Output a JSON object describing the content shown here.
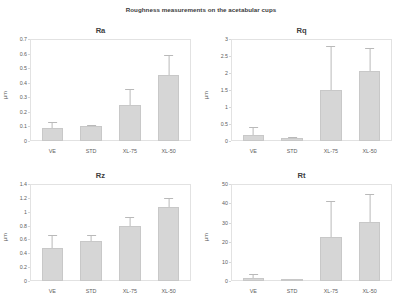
{
  "figure": {
    "title": "Roughness measurements on the acetabular cups"
  },
  "chart_data": [
    {
      "type": "bar",
      "title": "Ra",
      "xlabel": "",
      "ylabel": "µm",
      "categories": [
        "VE",
        "STD",
        "XL-75",
        "XL-50"
      ],
      "values": [
        0.09,
        0.1,
        0.25,
        0.45
      ],
      "errors_upper": [
        0.13,
        0.11,
        0.36,
        0.59
      ],
      "ylim": [
        0,
        0.7
      ],
      "yticks": [
        "0.7",
        "0.6",
        "0.5",
        "0.4",
        "0.3",
        "0.2",
        "0.1",
        "0"
      ],
      "grid": false,
      "legend": "none"
    },
    {
      "type": "bar",
      "title": "Rq",
      "xlabel": "",
      "ylabel": "µm",
      "categories": [
        "VE",
        "STD",
        "XL-75",
        "XL-50"
      ],
      "values": [
        0.18,
        0.08,
        1.5,
        2.05
      ],
      "errors_upper": [
        0.42,
        0.12,
        2.8,
        2.75
      ],
      "ylim": [
        0,
        3
      ],
      "yticks": [
        "3",
        "2.5",
        "2",
        "1.5",
        "1",
        "0.5",
        "0"
      ],
      "grid": false,
      "legend": "none"
    },
    {
      "type": "bar",
      "title": "Rz",
      "xlabel": "",
      "ylabel": "µm",
      "categories": [
        "VE",
        "STD",
        "XL-75",
        "XL-50"
      ],
      "values": [
        0.48,
        0.58,
        0.79,
        1.07
      ],
      "errors_upper": [
        0.66,
        0.66,
        0.92,
        1.2
      ],
      "ylim": [
        0,
        1.4
      ],
      "yticks": [
        "1.4",
        "1.2",
        "1",
        "0.8",
        "0.6",
        "0.4",
        "0.2",
        "0"
      ],
      "grid": false,
      "legend": "none"
    },
    {
      "type": "bar",
      "title": "Rt",
      "xlabel": "",
      "ylabel": "µm",
      "categories": [
        "VE",
        "STD",
        "XL-75",
        "XL-50"
      ],
      "values": [
        1.5,
        0.8,
        22.5,
        30.5
      ],
      "errors_upper": [
        3.5,
        1.2,
        41.0,
        45.0
      ],
      "ylim": [
        0,
        50
      ],
      "yticks": [
        "50",
        "40",
        "30",
        "20",
        "10",
        "0"
      ],
      "grid": false,
      "legend": "none"
    }
  ],
  "style": {
    "bar_fill": "#d6d6d6",
    "bar_stroke": "#c8c8c8",
    "error_color": "#b9b9b9",
    "axis_color": "#e2e2e2",
    "text_color": "#555555"
  }
}
